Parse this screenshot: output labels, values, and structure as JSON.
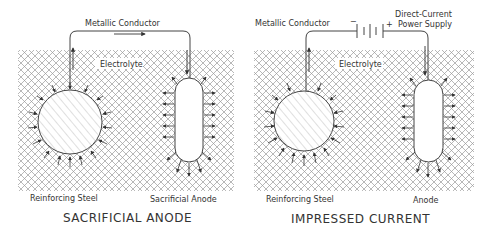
{
  "colors": {
    "line": "#444444",
    "hatch": "#9a9a9a",
    "body_hatch": "#bbbbbb",
    "text": "#333333",
    "background": "#ffffff"
  },
  "panels": [
    {
      "id": "sacrificial",
      "title": "SACRIFICIAL ANODE",
      "conductor_label": "Metallic Conductor",
      "electrolyte_label": "Electrolyte",
      "steel_label": "Reinforcing Steel",
      "anode_label": "Sacrificial Anode",
      "current_direction_icon": "arrow-right-icon"
    },
    {
      "id": "impressed",
      "title": "IMPRESSED CURRENT",
      "conductor_label": "Metallic Conductor",
      "electrolyte_label": "Electrolyte",
      "steel_label": "Reinforcing Steel",
      "anode_label": "Anode",
      "power_supply_label_line1": "Direct-Current",
      "power_supply_label_line2": "Power Supply",
      "negative_symbol": "−",
      "positive_symbol": "+",
      "power_supply_icon": "battery-icon"
    }
  ]
}
